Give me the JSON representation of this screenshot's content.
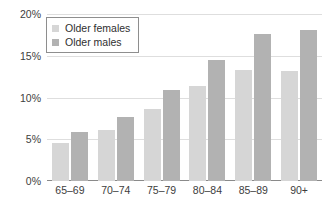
{
  "chart_data": {
    "type": "bar",
    "title": "",
    "subtitle": "",
    "xlabel": "",
    "ylabel": "",
    "categories": [
      "65–69",
      "70–74",
      "75–79",
      "80–84",
      "85–89",
      "90+"
    ],
    "series": [
      {
        "name": "Older females",
        "color": "#d6d6d6",
        "values": [
          4.6,
          6.1,
          8.7,
          11.4,
          13.4,
          13.3
        ]
      },
      {
        "name": "Older males",
        "color": "#b2b2b2",
        "values": [
          5.9,
          7.7,
          11.0,
          14.6,
          17.7,
          18.2
        ]
      }
    ],
    "ylim": [
      0,
      20
    ],
    "yticks": [
      0,
      5,
      10,
      15,
      20
    ],
    "ytick_labels": [
      "0%",
      "5%",
      "10%",
      "15%",
      "20%"
    ],
    "grid": true,
    "legend_position": "top-left",
    "annotations": []
  },
  "legend": {
    "items": [
      {
        "label": "Older females"
      },
      {
        "label": "Older males"
      }
    ]
  },
  "axis": {
    "y_labels": [
      "20%",
      "15%",
      "10%",
      "5%",
      "0%"
    ],
    "x_labels": [
      "65–69",
      "70–74",
      "75–79",
      "80–84",
      "85–89",
      "90+"
    ]
  },
  "colors": {
    "females": "#d6d6d6",
    "males": "#b2b2b2",
    "gridline": "#dedede",
    "axis": "#8a8a8a",
    "text": "#3d3d3d",
    "background": "#ffffff"
  }
}
